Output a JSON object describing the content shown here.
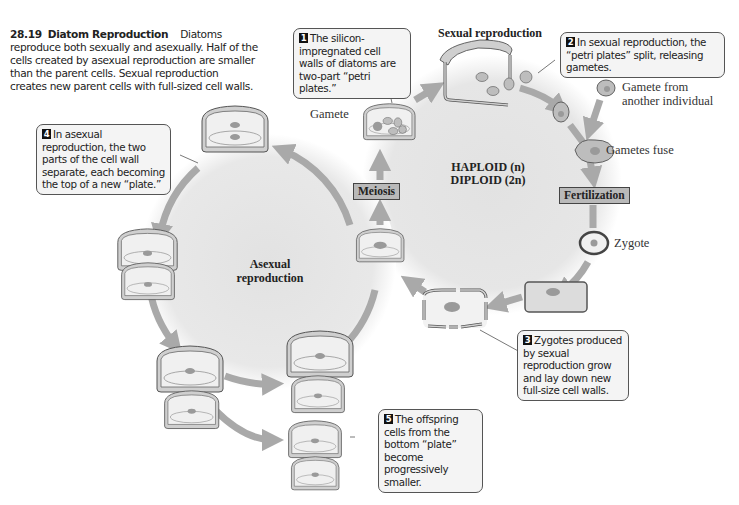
{
  "caption": {
    "figure_number": "28.19",
    "title": "Diatom Reproduction",
    "text": "Diatoms reproduce both sexually and asexually. Half of the cells created by asexual reproduction are smaller than the parent cells. Sexual reproduction creates new parent cells with full-sized cell walls."
  },
  "cycles": {
    "sexual": {
      "heading": "Sexual reproduction",
      "center_line1": "HAPLOID (n)",
      "center_line2": "DIPLOID (2n)"
    },
    "asexual": {
      "center_line1": "Asexual",
      "center_line2": "reproduction"
    }
  },
  "process_boxes": {
    "meiosis": "Meiosis",
    "fertilization": "Fertilization"
  },
  "labels": {
    "gamete": "Gamete",
    "gamete_other_line1": "Gamete from",
    "gamete_other_line2": "another individual",
    "gametes_fuse": "Gametes fuse",
    "zygote": "Zygote"
  },
  "callouts": [
    {
      "step": "1",
      "text": "The silicon-impregnated cell walls of diatoms are two-part “petri plates.”"
    },
    {
      "step": "2",
      "text": "In sexual reproduction, the “petri plates” split, releasing gametes."
    },
    {
      "step": "3",
      "text": "Zygotes produced by sexual reproduction grow and lay down new full-size cell walls."
    },
    {
      "step": "4",
      "text": "In asexual reproduction, the two parts of the cell wall separate, each becoming the top of a new “plate.”"
    },
    {
      "step": "5",
      "text": "The offspring cells from the bottom “plate” become progressively smaller."
    }
  ],
  "colors": {
    "arrow": "#a9a9a9",
    "cell_wall": "#c8c8c8",
    "cell_outline": "#555555",
    "nucleus": "#9a9a9a",
    "process_box": "#b9b9b9",
    "callout_bg": "#f4f4f4",
    "circle_bg": "#e6e6e6"
  }
}
